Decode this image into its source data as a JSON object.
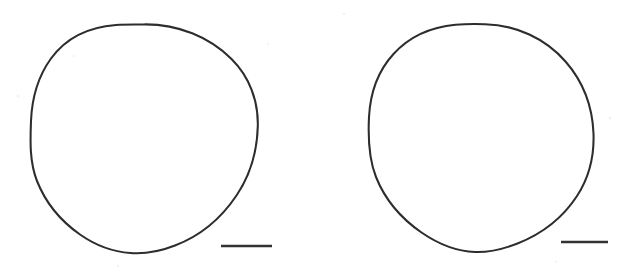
{
  "figure": {
    "title": "",
    "caption": "",
    "background_color": "#ffffff",
    "ink_color": "#2e2d2c",
    "width": 634,
    "height": 279,
    "medium": "scanned line drawing",
    "panel_count": 2
  },
  "panels": [
    {
      "id": "panel-left",
      "label": "",
      "shape": {
        "name": "circular-outline",
        "type": "closed-irregular-circle",
        "center_x": 144.5,
        "center_y": 140.0,
        "radius_x": 113.5,
        "radius_y": 116.0,
        "bounds": {
          "left": 31,
          "top": 24,
          "right": 258,
          "bottom": 256
        },
        "stroke_color": "#2e2d2c",
        "stroke_width": 2.05,
        "fill": "none"
      },
      "scale_bar": {
        "name": "scale-bar",
        "label": "",
        "x_start": 221,
        "x_end": 272,
        "y": 246,
        "length_px": 51,
        "thickness_px": 2.6,
        "color": "#333231"
      }
    },
    {
      "id": "panel-right",
      "label": "",
      "shape": {
        "name": "circular-outline",
        "type": "closed-irregular-circle",
        "center_x": 481.0,
        "center_y": 138.5,
        "radius_x": 113.0,
        "radius_y": 114.5,
        "bounds": {
          "left": 368,
          "top": 24,
          "right": 594,
          "bottom": 253
        },
        "stroke_color": "#2e2d2c",
        "stroke_width": 2.05,
        "fill": "none"
      },
      "scale_bar": {
        "name": "scale-bar",
        "label": "",
        "x_start": 561,
        "x_end": 608,
        "y": 242,
        "length_px": 47,
        "thickness_px": 2.6,
        "color": "#333231"
      }
    }
  ]
}
